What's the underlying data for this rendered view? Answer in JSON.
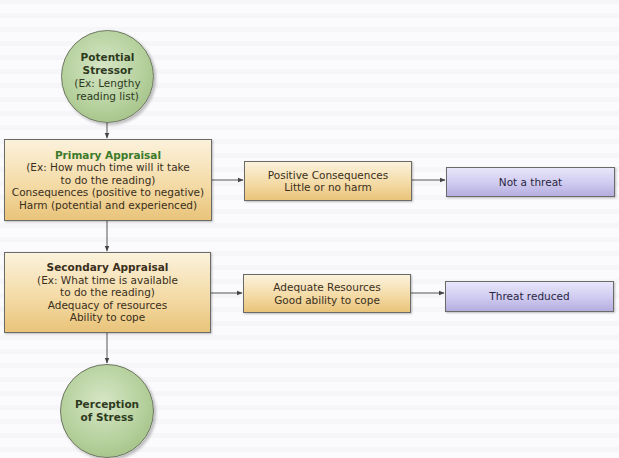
{
  "diagram": {
    "start_node": {
      "title_lines": [
        "Potential",
        "Stressor"
      ],
      "detail_lines": [
        "(Ex: Lengthy",
        "reading list)"
      ],
      "color": "#b5d09c"
    },
    "primary_appraisal": {
      "title": "Primary Appraisal",
      "title_color": "#3c7a2a",
      "lines": [
        "(Ex: How much time will it take",
        "to do the reading)",
        "Consequences (positive to negative)",
        "Harm (potential and experienced)"
      ]
    },
    "secondary_appraisal": {
      "title": "Secondary Appraisal",
      "lines": [
        "(Ex: What time is available",
        "to do the reading)",
        "Adequacy of resources",
        "Ability to cope"
      ]
    },
    "positive_consequences": {
      "lines": [
        "Positive Consequences",
        "Little or no harm"
      ]
    },
    "adequate_resources": {
      "lines": [
        "Adequate Resources",
        "Good ability to cope"
      ]
    },
    "not_a_threat": {
      "label": "Not a threat",
      "color": "#cfcaf0"
    },
    "threat_reduced": {
      "label": "Threat reduced",
      "color": "#cfcaf0"
    },
    "end_node": {
      "title_lines": [
        "Perception",
        "of Stress"
      ],
      "color": "#b5d09c"
    },
    "colors": {
      "tan_box": "#f4dba7",
      "purple_box": "#cfcaf0",
      "circle": "#b5d09c",
      "connector": "#555555"
    }
  }
}
